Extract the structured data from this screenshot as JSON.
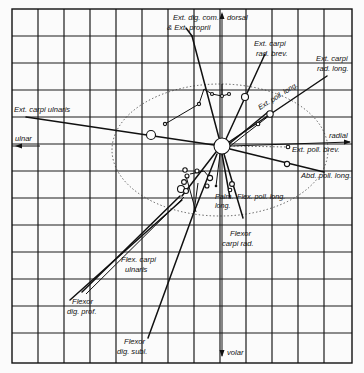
{
  "diagram": {
    "type": "muscle moment-arm diagram of the wrist (radial/ulnar vs dorsal/volar axes)",
    "axes": {
      "dorsal": "dorsal",
      "volar": "volar",
      "radial": "radial",
      "ulnar": "ulnar"
    },
    "muscles": {
      "ext_dig_com_1": "Ext. dig. com.",
      "ext_dig_com_2": "& Ext. proprii",
      "ext_carpi_rad_brev_1": "Ext. carpi",
      "ext_carpi_rad_brev_2": "rad. brev.",
      "ext_carpi_rad_long_1": "Ext. carpi",
      "ext_carpi_rad_long_2": "rad. long.",
      "ext_poll_long": "Ext. poll. long.",
      "ext_carpi_ulnaris": "Ext. carpi ulnaris",
      "ext_poll_brev": "Ext. poll. brev.",
      "abd_poll_long": "Abd. poll. long.",
      "palm_long_1": "Palm.",
      "palm_long_2": "long.",
      "flex_poll_long": "Flex. poll. long.",
      "flexor_carpi_rad_1": "Flexor",
      "flexor_carpi_rad_2": "carpi rad.",
      "flex_carpi_ulnaris_1": "Flex. carpi",
      "flex_carpi_ulnaris_2": "ulnaris",
      "flexor_dig_prof_1": "Flexor",
      "flexor_dig_prof_2": "dig. prof.",
      "flexor_dig_subl_1": "Flexor",
      "flexor_dig_subl_2": "dig. subl."
    },
    "grid": {
      "columns": 13,
      "rows": 13
    },
    "colors": {
      "ink": "#111111",
      "paper": "#fbfbfb"
    }
  }
}
